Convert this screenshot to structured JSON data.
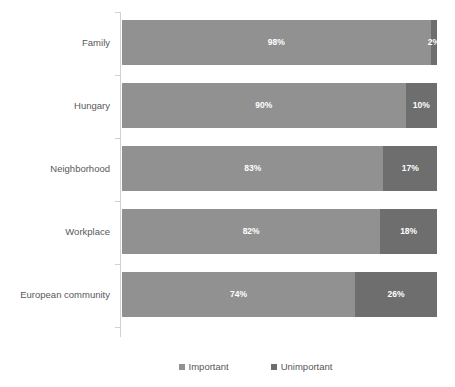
{
  "chart_data": {
    "type": "bar",
    "subtype": "stacked-horizontal-100pct",
    "title": "",
    "subtitle": "",
    "xlabel": "",
    "ylabel": "",
    "xlim": [
      0,
      100
    ],
    "grid": false,
    "legend_position": "bottom-right",
    "categories": [
      "Family",
      "Hungary",
      "Neighborhood",
      "Workplace",
      "European community"
    ],
    "series": [
      {
        "name": "Important",
        "color": "#919191",
        "values": [
          98,
          90,
          83,
          82,
          74
        ],
        "labels": [
          "98%",
          "90%",
          "83%",
          "82%",
          "74%"
        ]
      },
      {
        "name": "Unimportant",
        "color": "#6e6e6e",
        "values": [
          2,
          10,
          17,
          18,
          26
        ],
        "labels": [
          "2%",
          "10%",
          "17%",
          "18%",
          "26%"
        ]
      }
    ]
  },
  "legend": {
    "items": [
      {
        "label": "Important",
        "color": "#919191"
      },
      {
        "label": "Unimportant",
        "color": "#6e6e6e"
      }
    ]
  },
  "axis": {
    "line_color": "#d2d2d2",
    "label_color": "#585858"
  }
}
